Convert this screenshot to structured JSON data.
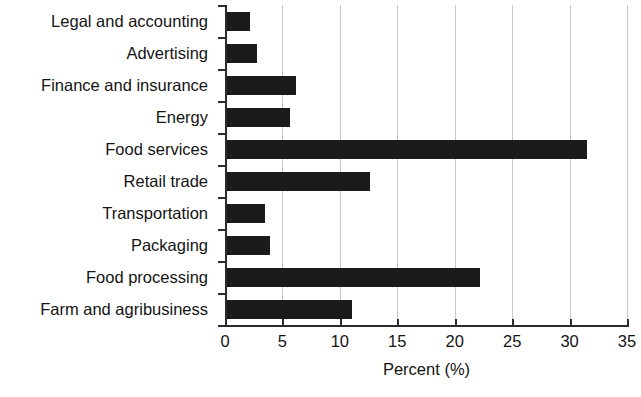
{
  "chart_data": {
    "type": "bar",
    "orientation": "horizontal",
    "title": "",
    "subtitle": "",
    "xlabel": "Percent (%)",
    "ylabel": "",
    "xlim": [
      0,
      35
    ],
    "xticks": [
      "0",
      "5",
      "10",
      "15",
      "20",
      "25",
      "30",
      "35"
    ],
    "xtick_values": [
      0,
      5,
      10,
      15,
      20,
      25,
      30,
      35
    ],
    "grid": "vertical",
    "legend": "none",
    "bar_color": "#1b1b1b",
    "gridline_color": "#c8c8c8",
    "axis_color": "#2b2b2b",
    "categories": [
      "Legal and accounting",
      "Advertising",
      "Finance and insurance",
      "Energy",
      "Food services",
      "Retail trade",
      "Transportation",
      "Packaging",
      "Food processing",
      "Farm and agribusiness"
    ],
    "values": [
      2.2,
      2.8,
      6.2,
      5.7,
      31.5,
      12.6,
      3.5,
      3.9,
      22.2,
      11.1
    ]
  }
}
